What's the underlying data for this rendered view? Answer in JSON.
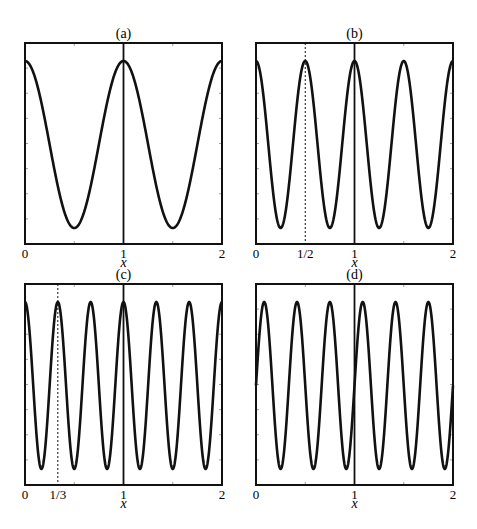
{
  "figure": {
    "width": 477,
    "height": 529,
    "line_color": "#111111",
    "background": "#ffffff"
  },
  "chart_data": [
    {
      "type": "line",
      "panel": "(a)",
      "title": "(a)",
      "xlabel": "x",
      "ylabel": "",
      "xlim": [
        0,
        2
      ],
      "xticks": [
        0,
        1,
        2
      ],
      "xtick_labels": [
        "0",
        "1",
        "2"
      ],
      "minor_xticks": [
        0.5,
        1.5
      ],
      "yticks_labeled": false,
      "function": "cos(2*pi*x)",
      "frequency": 1,
      "phase": 0,
      "vertical_lines": [
        {
          "x": 1,
          "style": "solid"
        }
      ],
      "series": [
        {
          "name": "u(x)",
          "x": [
            0,
            0.25,
            0.5,
            0.75,
            1,
            1.25,
            1.5,
            1.75,
            2
          ],
          "values": [
            1,
            0,
            -1,
            0,
            1,
            0,
            -1,
            0,
            1
          ]
        }
      ]
    },
    {
      "type": "line",
      "panel": "(b)",
      "title": "(b)",
      "xlabel": "x",
      "ylabel": "",
      "xlim": [
        0,
        2
      ],
      "xticks": [
        0,
        0.5,
        1,
        2
      ],
      "xtick_labels": [
        "0",
        "1/2",
        "1",
        "2"
      ],
      "minor_xticks": [
        1.5
      ],
      "yticks_labeled": false,
      "function": "cos(4*pi*x)",
      "frequency": 2,
      "phase": 0,
      "vertical_lines": [
        {
          "x": 0.5,
          "style": "dashed"
        },
        {
          "x": 1,
          "style": "solid"
        }
      ],
      "series": [
        {
          "name": "u(x)",
          "x": [
            0,
            0.25,
            0.5,
            0.75,
            1,
            1.25,
            1.5,
            1.75,
            2
          ],
          "values": [
            1,
            -1,
            1,
            -1,
            1,
            -1,
            1,
            -1,
            1
          ]
        }
      ]
    },
    {
      "type": "line",
      "panel": "(c)",
      "title": "(c)",
      "xlabel": "x",
      "ylabel": "",
      "xlim": [
        0,
        2
      ],
      "xticks": [
        0,
        0.3333,
        1,
        2
      ],
      "xtick_labels": [
        "0",
        "1/3",
        "1",
        "2"
      ],
      "minor_xticks": [
        0.5,
        1.5
      ],
      "yticks_labeled": false,
      "function": "cos(6*pi*x)",
      "frequency": 3,
      "phase": 0,
      "vertical_lines": [
        {
          "x": 0.3333,
          "style": "dashed"
        },
        {
          "x": 1,
          "style": "solid"
        }
      ],
      "series": [
        {
          "name": "u(x)",
          "x": [
            0,
            0.1667,
            0.3333,
            0.5,
            0.6667,
            0.8333,
            1,
            1.1667,
            1.3333,
            1.5,
            1.6667,
            1.8333,
            2
          ],
          "values": [
            1,
            -1,
            1,
            -1,
            1,
            -1,
            1,
            -1,
            1,
            -1,
            1,
            -1,
            1
          ]
        }
      ]
    },
    {
      "type": "line",
      "panel": "(d)",
      "title": "(d)",
      "xlabel": "x",
      "ylabel": "",
      "xlim": [
        0,
        2
      ],
      "xticks": [
        0,
        1,
        2
      ],
      "xtick_labels": [
        "0",
        "1",
        "2"
      ],
      "minor_xticks": [
        0.5,
        1.5
      ],
      "yticks_labeled": false,
      "function": "sin(6*pi*x)",
      "frequency": 3,
      "phase": -1.5708,
      "vertical_lines": [
        {
          "x": 1,
          "style": "solid"
        }
      ],
      "series": [
        {
          "name": "u(x)",
          "x": [
            0,
            0.0833,
            0.25,
            0.4167,
            0.5833,
            0.75,
            0.9167,
            1,
            1.0833,
            1.25,
            1.4167,
            1.5833,
            1.75,
            1.9167,
            2
          ],
          "values": [
            0,
            1,
            -1,
            1,
            -1,
            1,
            -1,
            0,
            1,
            -1,
            1,
            -1,
            1,
            -1,
            0
          ]
        }
      ]
    }
  ],
  "panels": [
    {
      "title": "(a)",
      "xlabel": "x",
      "ticks": [
        "0",
        "1",
        "2"
      ]
    },
    {
      "title": "(b)",
      "xlabel": "x",
      "ticks": [
        "0",
        "1/2",
        "1",
        "2"
      ]
    },
    {
      "title": "(c)",
      "xlabel": "x",
      "ticks": [
        "0",
        "1/3",
        "1",
        "2"
      ]
    },
    {
      "title": "(d)",
      "xlabel": "x",
      "ticks": [
        "0",
        "1",
        "2"
      ]
    }
  ]
}
